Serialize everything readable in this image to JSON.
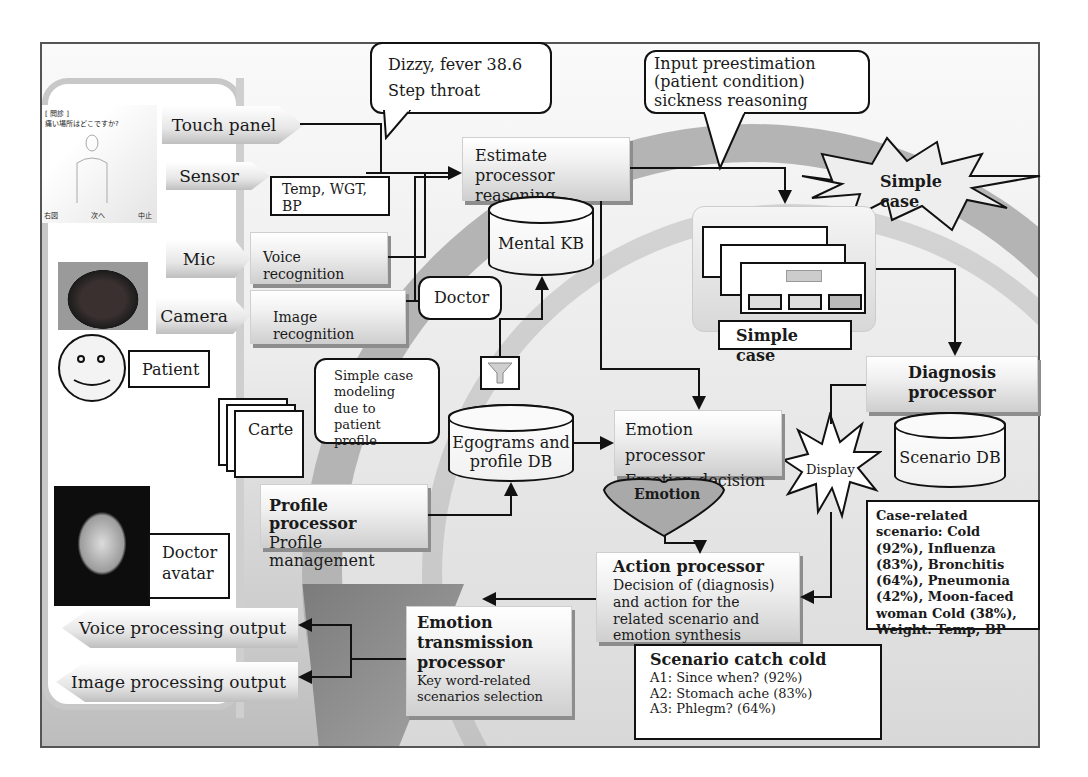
{
  "diagram": {
    "inputs": {
      "touch_panel": "Touch panel",
      "sensor": "Sensor",
      "mic": "Mic",
      "camera": "Camera"
    },
    "sensor_readings": "Temp, WGT, BP",
    "symptom_bubble": {
      "line1": "Dizzy, fever 38.6",
      "line2": "Step throat"
    },
    "preestimation_bubble": "Input preestimation (patient condition) sickness reasoning",
    "estimate_processor": "Estimate processor reasoning",
    "voice_recognition": "Voice recognition",
    "image_recognition": "Image recognition",
    "mental_kb": "Mental KB",
    "doctor_bubble": "Doctor",
    "patient_label": "Patient",
    "simple_case_burst": "Simple case",
    "simple_case_label": "Simple case",
    "modeling_bubble": "Simple case modeling due to patient profile",
    "carte_label": "Carte",
    "egograms_db": "Egograms and profile DB",
    "profile_processor": {
      "title": "Profile processor",
      "subtitle": "Profile management"
    },
    "emotion_processor": {
      "line1": "Emotion processor",
      "line2": "Emotion decision"
    },
    "emotion_heart": "Emotion",
    "display_burst": "Display",
    "diagnosis_processor": "Diagnosis processor",
    "scenario_db": "Scenario DB",
    "case_scenario_box": "Case-related scenario: Cold (92%), Influenza (83%), Bronchitis (64%), Pneumonia (42%), Moon-faced woman Cold (38%), Weight. Temp, BP",
    "action_processor": {
      "title": "Action processor",
      "description": "Decision of (diagnosis) and action for the related scenario and emotion synthesis"
    },
    "emotion_transmission": {
      "title": "Emotion transmission processor",
      "description": "Key word-related scenarios selection"
    },
    "doctor_avatar": "Doctor avatar",
    "outputs": {
      "voice": "Voice processing output",
      "image": "Image processing output"
    },
    "scenario_catch_cold": {
      "title": "Scenario catch cold",
      "items": [
        "A1: Since when? (92%)",
        "A2: Stomach ache (83%)",
        "A3: Phlegm? (64%)"
      ]
    },
    "touch_screen": {
      "header": "[ 問診 ]",
      "question": "痛い場所はどこですか?",
      "buttons": [
        "右図",
        "次へ",
        "中止"
      ]
    }
  },
  "colors": {
    "border": "#111111",
    "panel_gray": "#c8c8c8",
    "arc_gray": "#b4b4b4",
    "box_fill": "#f0f0f0"
  }
}
